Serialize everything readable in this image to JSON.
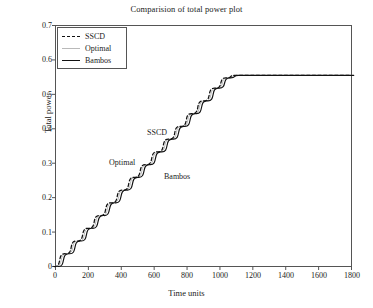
{
  "chart_data": {
    "type": "line",
    "title": "Comparision of total power plot",
    "xlabel": "Time units",
    "ylabel": "Total power",
    "xlim": [
      0,
      1800
    ],
    "ylim": [
      0,
      0.7
    ],
    "xticks": [
      "0",
      "200",
      "400",
      "600",
      "800",
      "1000",
      "1200",
      "1400",
      "1600",
      "1800"
    ],
    "xtick_values": [
      0,
      200,
      400,
      600,
      800,
      1000,
      1200,
      1400,
      1600,
      1800
    ],
    "yticks": [
      "0",
      "0.1",
      "0.2",
      "0.3",
      "0.4",
      "0.5",
      "0.6",
      "0.7"
    ],
    "ytick_values": [
      0,
      0.1,
      0.2,
      0.3,
      0.4,
      0.5,
      0.6,
      0.7
    ],
    "grid": false,
    "legend_position": "upper left",
    "plateau_value": 0.555,
    "plateau_start_x": 1100,
    "step_count": 15,
    "step_width": 70,
    "step_rise": 0.037,
    "series": [
      {
        "name": "SSCD",
        "style": "dashed",
        "color": "#111111",
        "x": [
          0,
          70,
          140,
          210,
          280,
          350,
          420,
          490,
          560,
          630,
          700,
          770,
          840,
          910,
          980,
          1050,
          1100,
          1800
        ],
        "y": [
          0,
          0.037,
          0.074,
          0.111,
          0.148,
          0.185,
          0.222,
          0.259,
          0.296,
          0.333,
          0.37,
          0.407,
          0.444,
          0.481,
          0.518,
          0.548,
          0.555,
          0.555
        ]
      },
      {
        "name": "Optimal",
        "style": "solid-light",
        "color": "#b9b9b9",
        "x": [
          0,
          70,
          140,
          210,
          280,
          350,
          420,
          490,
          560,
          630,
          700,
          770,
          840,
          910,
          980,
          1050,
          1100,
          1800
        ],
        "y": [
          0,
          0.037,
          0.074,
          0.111,
          0.148,
          0.185,
          0.222,
          0.259,
          0.296,
          0.333,
          0.37,
          0.407,
          0.444,
          0.481,
          0.518,
          0.548,
          0.555,
          0.555
        ]
      },
      {
        "name": "Bambos",
        "style": "solid",
        "color": "#111111",
        "x": [
          0,
          70,
          140,
          210,
          280,
          350,
          420,
          490,
          560,
          630,
          700,
          770,
          840,
          910,
          980,
          1050,
          1100,
          1800
        ],
        "y": [
          0,
          0.037,
          0.074,
          0.111,
          0.148,
          0.185,
          0.222,
          0.259,
          0.296,
          0.333,
          0.37,
          0.407,
          0.444,
          0.481,
          0.518,
          0.548,
          0.555,
          0.555
        ]
      }
    ],
    "annotations": [
      {
        "text": "SSCD",
        "x": 640,
        "y": 0.405
      },
      {
        "text": "Optimal",
        "x": 450,
        "y": 0.318
      },
      {
        "text": "Bambos",
        "x": 720,
        "y": 0.275
      }
    ]
  },
  "legend": {
    "entries": [
      {
        "label": "SSCD"
      },
      {
        "label": "Optimal"
      },
      {
        "label": "Bambos"
      }
    ]
  }
}
